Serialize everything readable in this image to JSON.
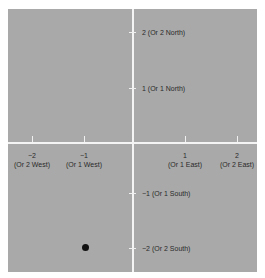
{
  "diagram": {
    "type": "coordinate-plane",
    "x_ticks": [
      {
        "value": "−2",
        "label": "(Or 2 West)"
      },
      {
        "value": "−1",
        "label": "(Or 1 West)"
      },
      {
        "value": "1",
        "label": "(Or 1 East)"
      },
      {
        "value": "2",
        "label": "(Or 2 East)"
      }
    ],
    "y_ticks": [
      {
        "label": "2 (Or 2 North)"
      },
      {
        "label": "1 (Or 1 North)"
      },
      {
        "label": "−1 (Or 1 South)"
      },
      {
        "label": "−2 (Or 2 South)"
      }
    ],
    "point": {
      "x": -1,
      "y": -2
    },
    "colors": {
      "background": "#a9a9a9",
      "axes": "#f4f4f4",
      "point": "#111111"
    }
  }
}
